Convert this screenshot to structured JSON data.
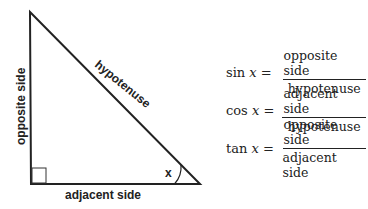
{
  "triangle": {
    "vertices": {
      "top": [
        30,
        12
      ],
      "bottom_left": [
        31,
        184
      ],
      "bottom_right": [
        200,
        184
      ]
    },
    "labels": {
      "opposite": "opposite side",
      "hypotenuse": "hypotenuse",
      "adjacent": "adjacent side",
      "angle": "x"
    }
  },
  "formulas": [
    {
      "func": "sin",
      "var": "x",
      "eq": "=",
      "numerator": "opposite side",
      "denominator": "hypotenuse"
    },
    {
      "func": "cos",
      "var": "x",
      "eq": "=",
      "numerator": "adjacent side",
      "denominator": "hypotenuse"
    },
    {
      "func": "tan",
      "var": "x",
      "eq": "=",
      "numerator": "opposite side",
      "denominator": "adjacent side"
    }
  ]
}
